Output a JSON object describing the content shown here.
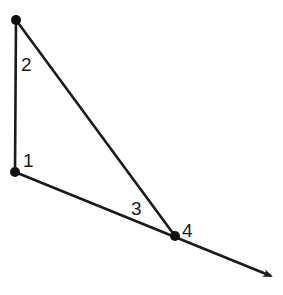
{
  "diagram": {
    "type": "geometry-angles",
    "vertices": [
      {
        "id": "top"
      },
      {
        "id": "bottom-left"
      },
      {
        "id": "bottom-right"
      }
    ],
    "angle_labels": [
      "1",
      "2",
      "3",
      "4"
    ],
    "colors": {
      "stroke": "#1a1a1a",
      "background": "#ffffff"
    }
  }
}
